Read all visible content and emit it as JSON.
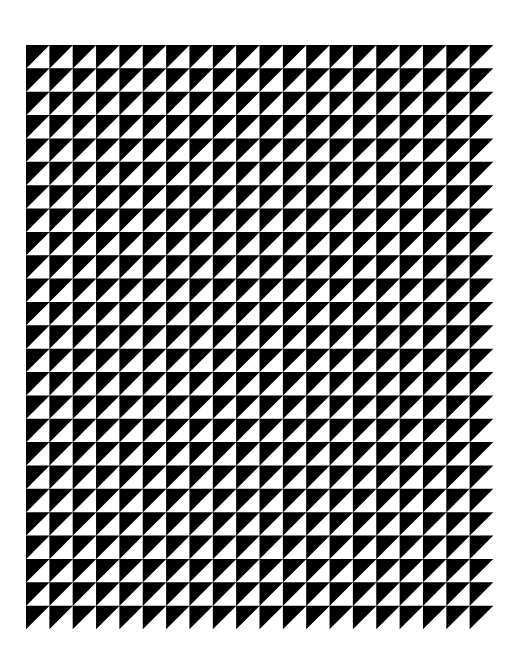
{
  "artwork": {
    "description": "Geometric pattern of right triangles in a grid",
    "background": "#ffffff",
    "grid": {
      "x": 26,
      "y": 45,
      "width": 467,
      "height": 584,
      "columns": 20,
      "rows": 25
    },
    "cell": {
      "filled_triangle": "upper-left",
      "diagonal": "bottom-left to top-right",
      "fill_color": "#000000",
      "empty_color": "#ffffff"
    }
  }
}
